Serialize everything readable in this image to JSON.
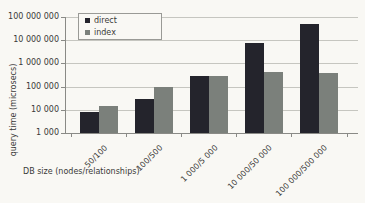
{
  "chart_data": {
    "type": "bar",
    "title": "",
    "xlabel": "DB size (nodes/relationships)",
    "ylabel": "query time (microsecs)",
    "scale": "log",
    "ylim": [
      1000,
      100000000
    ],
    "grid": true,
    "legend_position": "top-left-inside",
    "y_tick_labels": [
      "100 000 000",
      "10 000 000",
      "1 000 000",
      "100 000",
      "10 000",
      "1 000"
    ],
    "categories": [
      "50/100",
      "100/500",
      "1 000/5 000",
      "10 000/50 000",
      "100 000/500 000"
    ],
    "series": [
      {
        "name": "direct",
        "color": "#24242c",
        "values": [
          8000,
          30000,
          300000,
          7500000,
          50000000
        ]
      },
      {
        "name": "index",
        "color": "#7b807b",
        "values": [
          15000,
          100000,
          280000,
          430000,
          400000
        ]
      }
    ]
  },
  "style_colors": {
    "background": "#f9f8f4",
    "gridline": "#c6c6c0",
    "axis": "#8a8a86",
    "text": "#3a3a38"
  }
}
